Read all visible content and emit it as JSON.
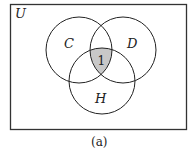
{
  "diagram": {
    "type": "venn",
    "universe_label": "U",
    "sets": [
      {
        "name": "C",
        "cx": 79,
        "cy": 50,
        "r": 33
      },
      {
        "name": "D",
        "cx": 123,
        "cy": 50,
        "r": 33
      },
      {
        "name": "H",
        "cx": 102,
        "cy": 81,
        "r": 33
      }
    ],
    "shaded_region": {
      "label": "1",
      "description": "C ∩ D ∩ H",
      "fill": "#c8c8c8"
    },
    "caption": "(a)"
  }
}
